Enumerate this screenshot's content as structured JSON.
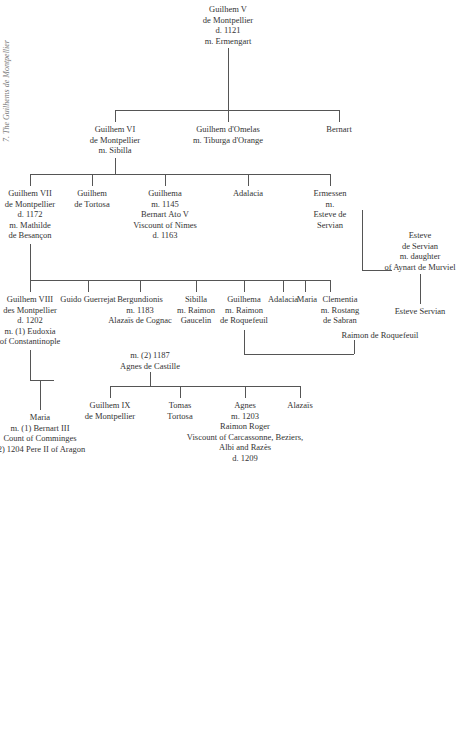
{
  "caption": "7. The Guilhems de Montpellier",
  "people": {
    "g5": [
      "Guilhem V",
      "de Montpellier",
      "d. 1121",
      "m. Ermengart"
    ],
    "g6": [
      "Guilhem VI",
      "de Montpellier",
      "m. Sibilla"
    ],
    "gomelas": [
      "Guilhem d'Omelas",
      "m. Tiburga d'Orange"
    ],
    "adalacia1": [
      "Adalacia"
    ],
    "bernart": [
      "Bernart"
    ],
    "g7": [
      "Guilhem VII",
      "de Montpellier",
      "d. 1172",
      "m. Mathilde",
      "de Besançon"
    ],
    "gtortosa": [
      "Guilhem",
      "de Tortosa"
    ],
    "guilhema1": [
      "Guilhema",
      "m. 1145",
      "Bernart Ato V",
      "Viscount of Nimes",
      "d. 1163"
    ],
    "ermessen": [
      "Ermessen",
      "m.",
      "Esteve de",
      "Servian"
    ],
    "esteve1": [
      "Esteve",
      "de Servian",
      "m. daughter",
      "of Aynart de Murviel"
    ],
    "esteve2": [
      "Esteve Servian"
    ],
    "g8": [
      "Guilhem VIII",
      "des Montpellier",
      "d. 1202",
      "m. (1) Eudoxia",
      "of Constantinople"
    ],
    "guido": [
      "Guido Guerrejat"
    ],
    "bergundionis": [
      "Bergundionis",
      "m. 1183",
      "Alazaïs de Cognac"
    ],
    "sibilla": [
      "Sibilla",
      "m. Raimon",
      "Gaucelin"
    ],
    "guilhema2": [
      "Guilhema",
      "m. Raimon",
      "de Roquefeuil"
    ],
    "adalacia2": [
      "Adalacia"
    ],
    "maria1": [
      "Maria"
    ],
    "clementia": [
      "Clementia",
      "m. Rostang",
      "de Sabran"
    ],
    "raimon": [
      "Raimon de Roquefeuil"
    ],
    "agnes_castille": [
      "m. (2) 1187",
      "Agnes de Castille"
    ],
    "maria2": [
      "Maria",
      "m. (1) Bernart III",
      "Count of Comminges",
      "(2) 1204 Pere II of Aragon"
    ],
    "g9": [
      "Guilhem IX",
      "de Montpellier"
    ],
    "tomas": [
      "Tomas",
      "Tortosa"
    ],
    "agnes": [
      "Agnes",
      "m. 1203",
      "Raimon Roger",
      "Viscount of Carcassonne, Beziers,",
      "Albi and Razès",
      "d. 1209"
    ],
    "alazais": [
      "Alazaïs"
    ]
  }
}
